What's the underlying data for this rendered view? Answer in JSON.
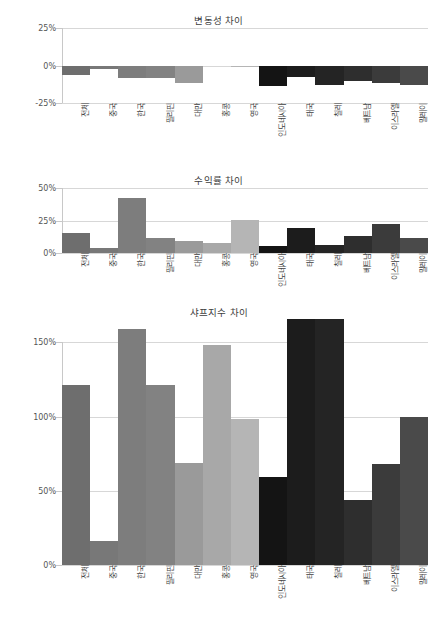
{
  "figure": {
    "background": "#ffffff",
    "width": 438,
    "height": 619
  },
  "categories": [
    "전체",
    "중국",
    "한국",
    "필리핀",
    "대만",
    "홍콩",
    "영국",
    "인도네시아",
    "태국",
    "칠레",
    "베트남",
    "이스라엘",
    "말레이"
  ],
  "colors": {
    "group_a": "#737373",
    "group_a_alt": "#8c8c8c",
    "group_a_light": "#a6a6a6",
    "group_a_lighter": "#b3b3b3",
    "group_b": "#1a1a1a",
    "group_b_alt": "#333333",
    "group_b_light": "#4d4d4d",
    "gridline": "#d7d7d7",
    "axis": "#c8c8c8",
    "text": "#3a3a3a"
  },
  "charts": [
    {
      "id": "volatility-difference",
      "title": "변동성 차이",
      "ylabel": "",
      "xlabel": "",
      "yticks": [
        "25%",
        "0%",
        "-25%"
      ],
      "ytick_values": [
        25,
        0,
        -25
      ],
      "ylim": [
        -25,
        25
      ],
      "values": [
        -6.5,
        -2.5,
        -8.0,
        -8.0,
        -11.5,
        0.0,
        -0.5,
        -13.5,
        -7.5,
        -13.0,
        -10.5,
        -11.5,
        -13.0
      ],
      "bar_colors": [
        "#6e6e6e",
        "#787878",
        "#7d7d7d",
        "#828282",
        "#9a9a9a",
        "#a8a8a8",
        "#b5b5b5",
        "#141414",
        "#1c1c1c",
        "#242424",
        "#2e2e2e",
        "#3b3b3b",
        "#4a4a4a"
      ]
    },
    {
      "id": "return-difference",
      "title": "수익률 차이",
      "ylabel": "",
      "xlabel": "",
      "yticks": [
        "50%",
        "25%",
        "0%"
      ],
      "ytick_values": [
        50,
        25,
        0
      ],
      "ylim": [
        0,
        50
      ],
      "values": [
        15.5,
        3.5,
        42.0,
        11.5,
        9.5,
        7.5,
        25.5,
        5.5,
        19.5,
        6.5,
        13.0,
        22.0,
        11.5
      ],
      "bar_colors": [
        "#6e6e6e",
        "#787878",
        "#7d7d7d",
        "#828282",
        "#9a9a9a",
        "#a8a8a8",
        "#b5b5b5",
        "#141414",
        "#1c1c1c",
        "#242424",
        "#2e2e2e",
        "#3b3b3b",
        "#4a4a4a"
      ]
    },
    {
      "id": "sharpe-index-difference",
      "title": "샤프지수 차이",
      "ylabel": "",
      "xlabel": "",
      "yticks": [
        "150%",
        "100%",
        "50%",
        "0%"
      ],
      "ytick_values": [
        150,
        100,
        50,
        0
      ],
      "ylim": [
        0,
        165
      ],
      "values": [
        121,
        16,
        159,
        121,
        69,
        148,
        98,
        59,
        166,
        166,
        44,
        68,
        100
      ],
      "bar_colors": [
        "#6e6e6e",
        "#787878",
        "#7d7d7d",
        "#828282",
        "#9a9a9a",
        "#a8a8a8",
        "#b5b5b5",
        "#141414",
        "#1c1c1c",
        "#242424",
        "#2e2e2e",
        "#3b3b3b",
        "#4a4a4a"
      ]
    }
  ],
  "chart_data": {
    "type": "bar",
    "categories": [
      "전체",
      "중국",
      "한국",
      "필리핀",
      "대만",
      "홍콩",
      "영국",
      "인도네시아",
      "태국",
      "칠레",
      "베트남",
      "이스라엘",
      "말레이"
    ],
    "panels": [
      {
        "title": "변동성 차이",
        "type": "bar",
        "xlabel": "",
        "ylabel": "",
        "ylim": [
          -25,
          25
        ],
        "ytick_labels": [
          "25%",
          "0%",
          "-25%"
        ],
        "grid": true,
        "legend": "none",
        "values": [
          -6.5,
          -2.5,
          -8.0,
          -8.0,
          -11.5,
          0.0,
          -0.5,
          -13.5,
          -7.5,
          -13.0,
          -10.5,
          -11.5,
          -13.0
        ]
      },
      {
        "title": "수익률 차이",
        "type": "bar",
        "xlabel": "",
        "ylabel": "",
        "ylim": [
          0,
          50
        ],
        "ytick_labels": [
          "50%",
          "25%",
          "0%"
        ],
        "grid": true,
        "legend": "none",
        "values": [
          15.5,
          3.5,
          42.0,
          11.5,
          9.5,
          7.5,
          25.5,
          5.5,
          19.5,
          6.5,
          13.0,
          22.0,
          11.5
        ]
      },
      {
        "title": "샤프지수 차이",
        "type": "bar",
        "xlabel": "",
        "ylabel": "",
        "ylim": [
          0,
          165
        ],
        "ytick_labels": [
          "150%",
          "100%",
          "50%",
          "0%"
        ],
        "grid": true,
        "legend": "none",
        "values": [
          121,
          16,
          159,
          121,
          69,
          148,
          98,
          59,
          166,
          166,
          44,
          68,
          100
        ]
      }
    ]
  }
}
